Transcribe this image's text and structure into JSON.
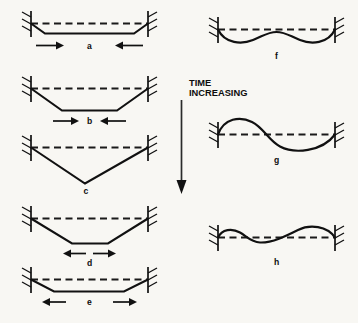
{
  "figure": {
    "kind": "engineering-diagram",
    "background_color": "#f8f7f3",
    "line_color": "#111111",
    "datum_color": "#1a1a1a",
    "canvas": {
      "width": 358,
      "height": 323
    }
  },
  "time_annotation": {
    "line1": "TIME",
    "line2": "INCREASING",
    "arrow_direction": "down",
    "arrow_semantic": "downward-arrow"
  },
  "columns": {
    "left_label": "",
    "right_label": ""
  },
  "panels": [
    {
      "id": "a",
      "label": "a",
      "column": "left",
      "shape": "shallow-trapezoid",
      "deflection_depth": 10,
      "load_arrows": "inward",
      "left_arrow_direction": "right",
      "right_arrow_direction": "left",
      "label_position": "between-arrows"
    },
    {
      "id": "b",
      "label": "b",
      "column": "left",
      "shape": "medium-trapezoid",
      "deflection_depth": 22,
      "load_arrows": "inward",
      "left_arrow_direction": "right",
      "right_arrow_direction": "left",
      "label_position": "between-arrows"
    },
    {
      "id": "c",
      "label": "c",
      "column": "left",
      "shape": "vee",
      "deflection_depth": 36,
      "load_arrows": "none",
      "left_arrow_direction": "",
      "right_arrow_direction": "",
      "label_position": "below-apex"
    },
    {
      "id": "d",
      "label": "d",
      "column": "left",
      "shape": "medium-trapezoid",
      "deflection_depth": 25,
      "load_arrows": "outward",
      "left_arrow_direction": "left",
      "right_arrow_direction": "right",
      "label_position": "between-arrows"
    },
    {
      "id": "e",
      "label": "e",
      "column": "left",
      "shape": "shallow-trapezoid",
      "deflection_depth": 12,
      "load_arrows": "outward",
      "left_arrow_direction": "left",
      "right_arrow_direction": "right",
      "label_position": "between-arrows"
    },
    {
      "id": "f",
      "label": "f",
      "column": "right",
      "shape": "double-dip-wave",
      "deflection_depth": 13,
      "load_arrows": "none",
      "left_arrow_direction": "",
      "right_arrow_direction": "",
      "label_position": "below-center"
    },
    {
      "id": "g",
      "label": "g",
      "column": "right",
      "shape": "s-wave",
      "deflection_depth": 15,
      "load_arrows": "none",
      "left_arrow_direction": "",
      "right_arrow_direction": "",
      "label_position": "below-center"
    },
    {
      "id": "h",
      "label": "h",
      "column": "right",
      "shape": "asymmetric-double-wave",
      "deflection_depth": 9,
      "load_arrows": "none",
      "left_arrow_direction": "",
      "right_arrow_direction": "",
      "label_position": "below-center"
    }
  ]
}
